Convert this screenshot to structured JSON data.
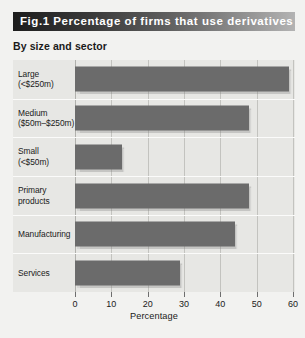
{
  "figure": {
    "title": "Fig.1 Percentage of firms that use derivatives",
    "subtitle": "By size and sector"
  },
  "chart_data": {
    "type": "bar",
    "orientation": "horizontal",
    "title": "Fig.1 Percentage of firms that use derivatives",
    "subtitle": "By size and sector",
    "categories": [
      "Large\n(<$250m)",
      "Medium\n($50m–$250m)",
      "Small\n(<$50m)",
      "Primary\nproducts",
      "Manufacturing",
      "Services"
    ],
    "category_lines": [
      [
        "Large",
        "(<$250m)"
      ],
      [
        "Medium",
        "($50m–$250m)"
      ],
      [
        "Small",
        "(<$50m)"
      ],
      [
        "Primary",
        "products"
      ],
      [
        "Manufacturing",
        ""
      ],
      [
        "Services",
        ""
      ]
    ],
    "values": [
      59,
      48,
      13,
      48,
      44,
      29
    ],
    "xlabel": "Percentage",
    "ylabel": "",
    "xlim": [
      0,
      60
    ],
    "xticks": [
      0,
      10,
      20,
      30,
      40,
      50,
      60
    ],
    "xtick_labels": [
      "0",
      "10",
      "20",
      "30",
      "40",
      "50",
      "60"
    ],
    "grid": "vertical",
    "legend": "none",
    "bar_color": "#6b6b6b",
    "plot_background": "#e7e7e4",
    "figure_background": "#f2f2f0"
  }
}
